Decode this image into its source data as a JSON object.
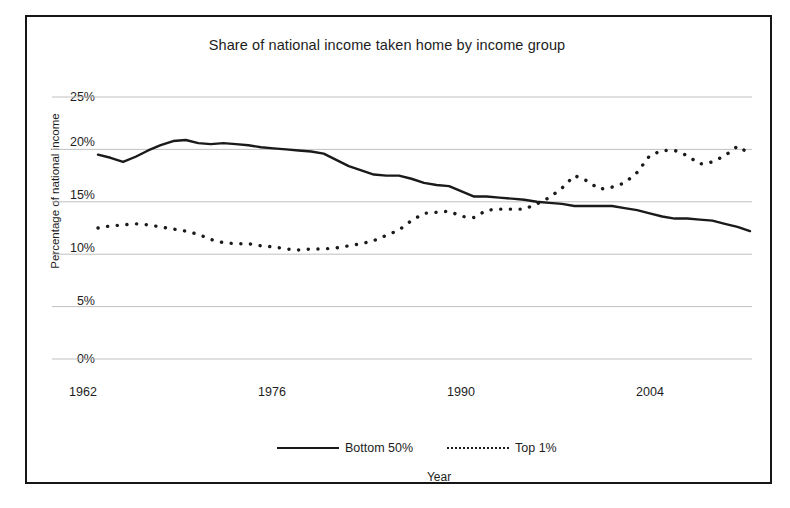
{
  "chart_data": {
    "type": "line",
    "title": "Share of national income taken home by income group",
    "xlabel": "Year",
    "ylabel": "Percentage of national income",
    "xlim": [
      1962,
      2014
    ],
    "ylim": [
      0,
      25
    ],
    "ytick_labels": [
      "0%",
      "5%",
      "10%",
      "15%",
      "20%",
      "25%"
    ],
    "ytick_values": [
      0,
      5,
      10,
      15,
      20,
      25
    ],
    "xtick_labels": [
      "1962",
      "1976",
      "1990",
      "2004"
    ],
    "xtick_values": [
      1962,
      1976,
      1990,
      2004
    ],
    "grid": "horizontal",
    "legend_position": "below-plot",
    "x": [
      1962,
      1963,
      1964,
      1965,
      1966,
      1967,
      1968,
      1969,
      1970,
      1971,
      1972,
      1973,
      1974,
      1975,
      1976,
      1977,
      1978,
      1979,
      1980,
      1981,
      1982,
      1983,
      1984,
      1985,
      1986,
      1987,
      1988,
      1989,
      1990,
      1991,
      1992,
      1993,
      1994,
      1995,
      1996,
      1997,
      1998,
      1999,
      2000,
      2001,
      2002,
      2003,
      2004,
      2005,
      2006,
      2007,
      2008,
      2009,
      2010,
      2011,
      2012,
      2013,
      2014
    ],
    "series": [
      {
        "name": "Bottom 50%",
        "style": "solid",
        "color": "#1a1a1a",
        "values": [
          19.5,
          19.2,
          18.8,
          19.3,
          19.9,
          20.4,
          20.8,
          20.9,
          20.6,
          20.5,
          20.6,
          20.5,
          20.4,
          20.2,
          20.1,
          20.0,
          19.9,
          19.8,
          19.6,
          19.0,
          18.4,
          18.0,
          17.6,
          17.5,
          17.5,
          17.2,
          16.8,
          16.6,
          16.5,
          16.0,
          15.5,
          15.5,
          15.4,
          15.3,
          15.2,
          15.0,
          14.9,
          14.8,
          14.6,
          14.6,
          14.6,
          14.6,
          14.4,
          14.2,
          13.9,
          13.6,
          13.4,
          13.4,
          13.3,
          13.2,
          12.9,
          12.6,
          12.2
        ],
        "final_value": 12.2
      },
      {
        "name": "Top 1%",
        "style": "dotted",
        "color": "#1a1a1a",
        "values": [
          12.5,
          12.7,
          12.8,
          12.9,
          12.8,
          12.6,
          12.4,
          12.2,
          11.9,
          11.4,
          11.1,
          11.0,
          11.0,
          10.8,
          10.7,
          10.5,
          10.4,
          10.5,
          10.5,
          10.6,
          10.8,
          11.0,
          11.3,
          11.8,
          12.3,
          13.2,
          13.9,
          14.0,
          14.1,
          13.6,
          13.5,
          14.2,
          14.3,
          14.3,
          14.3,
          14.8,
          15.4,
          16.3,
          17.5,
          17.0,
          16.2,
          16.4,
          16.8,
          17.8,
          19.4,
          19.9,
          19.9,
          19.4,
          18.6,
          18.8,
          19.4,
          20.3,
          19.6
        ],
        "final_value": 19.6
      }
    ]
  },
  "legend": {
    "entries": [
      {
        "label": "Bottom 50%"
      },
      {
        "label": "Top 1%"
      }
    ]
  }
}
